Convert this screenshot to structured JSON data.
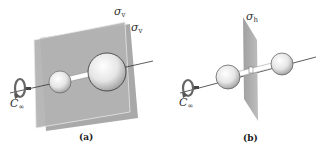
{
  "panels": [
    {
      "id": "a",
      "caption": "(a)",
      "description": "Linear molecule with two vertical mirror planes containing the molecular axis",
      "plane_labels": [
        {
          "symbol": "σ",
          "subscript": "v"
        },
        {
          "symbol": "σ",
          "subscript": "v"
        }
      ],
      "axis_label": {
        "symbol": "C",
        "subscript": "∞"
      },
      "atoms": [
        "small-sphere",
        "large-sphere"
      ]
    },
    {
      "id": "b",
      "caption": "(b)",
      "description": "Linear centrosymmetric molecule with horizontal mirror plane perpendicular to the molecular axis",
      "plane_labels": [
        {
          "symbol": "σ",
          "subscript": "h"
        }
      ],
      "axis_label": {
        "symbol": "C",
        "subscript": "∞"
      },
      "atoms": [
        "sphere",
        "sphere"
      ],
      "center_marker": "i"
    }
  ],
  "colors": {
    "plane_fill": "#a8a8a8",
    "plane_edge": "#e8e8e8",
    "sphere_light": "#fafafa",
    "sphere_dark": "#9a9a9a",
    "axis_line": "#333333"
  }
}
